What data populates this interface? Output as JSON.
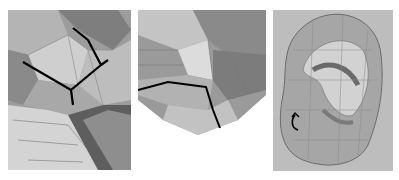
{
  "figure": {
    "panels": [
      {
        "id": "left",
        "subject": "nose-bridge-mesh",
        "annotation": "black edge-loop lines (Y junction)"
      },
      {
        "id": "middle",
        "subject": "nostril-mesh",
        "annotation": "black edge-loop line"
      },
      {
        "id": "right",
        "subject": "ear-mesh",
        "annotation": "black curved arrow"
      }
    ],
    "colors": {
      "background": "#ffffff",
      "mesh_light": "#c8c8c8",
      "mesh_mid": "#a0a0a0",
      "mesh_dark": "#6e6e6e",
      "edge": "#000000",
      "panel_bg": "#bdbdbd"
    }
  }
}
